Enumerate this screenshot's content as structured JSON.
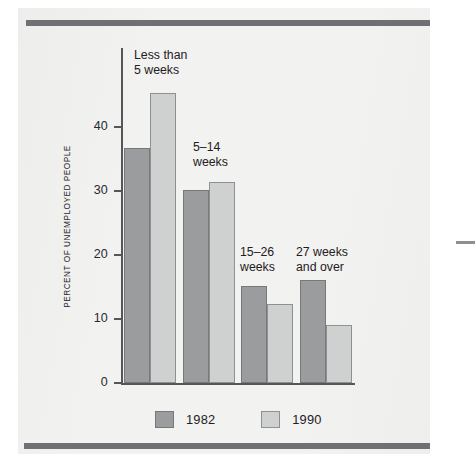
{
  "figure": {
    "background_color": "#f2f2f1",
    "rule_color": "#6f7073",
    "right_edge_tick": "right-edge-tick"
  },
  "chart_data": {
    "type": "bar",
    "title": "",
    "subtitle": "",
    "xlabel": "",
    "ylabel": "PERCENT OF UNEMPLOYED PEOPLE",
    "ylim": [
      0,
      48
    ],
    "yticks": [
      0,
      10,
      20,
      30,
      40
    ],
    "ytick_labels": [
      "0",
      "10",
      "20",
      "30",
      "40"
    ],
    "grid": false,
    "legend_position": "bottom",
    "categories": [
      "Less than\n5 weeks",
      "5–14\nweeks",
      "15–26\nweeks",
      "27 weeks\nand over"
    ],
    "series": [
      {
        "name": "1982",
        "color": "#9a9c9e",
        "values": [
          36.7,
          30.2,
          15.2,
          16.1
        ]
      },
      {
        "name": "1990",
        "color": "#cfd0d0",
        "values": [
          45.3,
          31.4,
          12.3,
          9.0
        ]
      }
    ],
    "annotations": [
      {
        "text": "Less than\n5 weeks",
        "group": 0
      },
      {
        "text": "5–14\nweeks",
        "group": 1
      },
      {
        "text": "15–26\nweeks",
        "group": 2
      },
      {
        "text": "27 weeks\nand over",
        "group": 3
      }
    ]
  },
  "legend": {
    "items": [
      {
        "label": "1982",
        "color": "#9a9c9e"
      },
      {
        "label": "1990",
        "color": "#cfd0d0"
      }
    ]
  }
}
